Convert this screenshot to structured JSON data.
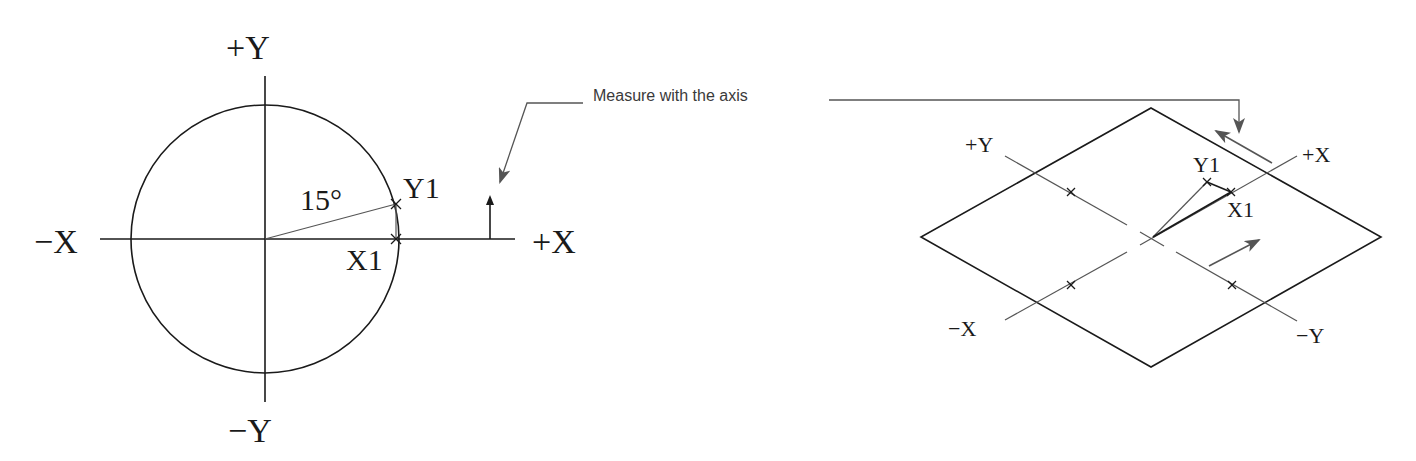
{
  "callout": {
    "text": "Measure with the axis"
  },
  "left_diagram": {
    "labels": {
      "pos_y": "+Y",
      "neg_y": "−Y",
      "neg_x": "−X",
      "pos_x": "+X",
      "angle": "15°",
      "y1": "Y1",
      "x1": "X1"
    },
    "angle_degrees": 15
  },
  "right_diagram": {
    "labels": {
      "pos_y": "+Y",
      "neg_y": "−Y",
      "neg_x": "−X",
      "pos_x": "+X",
      "y1": "Y1",
      "x1": "X1"
    }
  },
  "colors": {
    "line": "#1a1a1a",
    "axis_gray": "#555555",
    "arrow_gray": "#555555"
  }
}
